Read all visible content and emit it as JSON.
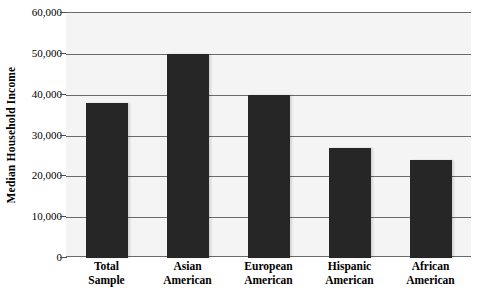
{
  "chart_data": {
    "type": "bar",
    "title": "",
    "xlabel": "",
    "ylabel": "Median Household Income",
    "categories": [
      "Total Sample",
      "Asian American",
      "European American",
      "Hispanic American",
      "African American"
    ],
    "category_lines": [
      [
        "Total",
        "Sample"
      ],
      [
        "Asian",
        "American"
      ],
      [
        "European",
        "American"
      ],
      [
        "Hispanic",
        "American"
      ],
      [
        "African",
        "American"
      ]
    ],
    "values": [
      38000,
      50000,
      40000,
      27000,
      24000
    ],
    "ylim": [
      0,
      60000
    ],
    "ytick_values": [
      0,
      10000,
      20000,
      30000,
      40000,
      50000,
      60000
    ],
    "ytick_labels": [
      "0",
      "10,000",
      "20,000",
      "30,000",
      "40,000",
      "50,000",
      "60,000"
    ],
    "grid": true,
    "legend": null,
    "bar_color": "#262626",
    "plot_background": "#f4f4f4",
    "gridline_color": "#6b6b6b"
  }
}
